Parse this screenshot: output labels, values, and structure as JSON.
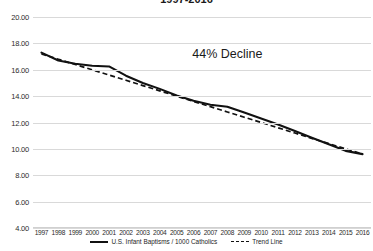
{
  "chart_data": {
    "type": "line",
    "title": "1997-2016",
    "xlabel": "",
    "ylabel": "",
    "ylim": [
      4.0,
      20.0
    ],
    "ytick_step": 2.0,
    "yticks": [
      "20.00",
      "18.00",
      "16.00",
      "14.00",
      "12.00",
      "10.00",
      "8.00",
      "6.00",
      "4.00"
    ],
    "grid": true,
    "legend_position": "bottom",
    "categories": [
      "1997",
      "1998",
      "1999",
      "2000",
      "2001",
      "2002",
      "2003",
      "2004",
      "2005",
      "2006",
      "2007",
      "2008",
      "2009",
      "2010",
      "2011",
      "2012",
      "2013",
      "2014",
      "2015",
      "2016"
    ],
    "series": [
      {
        "name": "U.S. Infant Baptisms / 1000 Catholics",
        "style": "solid",
        "color": "#111111",
        "values": [
          17.3,
          16.7,
          16.45,
          16.3,
          16.25,
          15.55,
          15.0,
          14.55,
          14.05,
          13.65,
          13.35,
          13.2,
          12.75,
          12.3,
          11.85,
          11.35,
          10.85,
          10.35,
          9.85,
          9.6
        ]
      },
      {
        "name": "Trend Line",
        "style": "dashed",
        "color": "#111111",
        "values": [
          17.2,
          16.8,
          16.4,
          16.0,
          15.6,
          15.2,
          14.8,
          14.4,
          14.0,
          13.6,
          13.2,
          12.8,
          12.4,
          12.0,
          11.6,
          11.2,
          10.8,
          10.4,
          10.0,
          9.6
        ]
      }
    ],
    "annotations": [
      {
        "text": "44% Decline",
        "x_category": "2008",
        "y_value": 17.2
      }
    ]
  },
  "legend": {
    "items": [
      {
        "label": "U.S. Infant Baptisms / 1000 Catholics",
        "style": "solid"
      },
      {
        "label": "Trend Line",
        "style": "dashed"
      }
    ]
  }
}
